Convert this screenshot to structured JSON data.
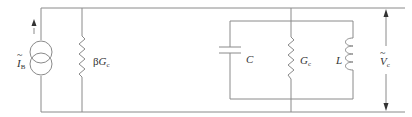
{
  "diagram": {
    "type": "circuit-schematic",
    "stroke_color": "#8a8a8a",
    "labels": {
      "source_symbol": "I",
      "source_sub": "B",
      "beta_symbol": "β",
      "beta_g": "G",
      "beta_sub": "c",
      "capacitor": "C",
      "tank_g": "G",
      "tank_g_sub": "c",
      "inductor": "L",
      "voltage_symbol": "V",
      "voltage_sub": "c"
    },
    "components": [
      {
        "id": "current-source",
        "label": "Ĩ_B"
      },
      {
        "id": "resistor-beta",
        "label": "βG_c"
      },
      {
        "id": "capacitor",
        "label": "C"
      },
      {
        "id": "resistor-gc",
        "label": "G_c"
      },
      {
        "id": "inductor",
        "label": "L"
      },
      {
        "id": "voltage-arrow",
        "label": "Ṽ_c"
      }
    ]
  }
}
